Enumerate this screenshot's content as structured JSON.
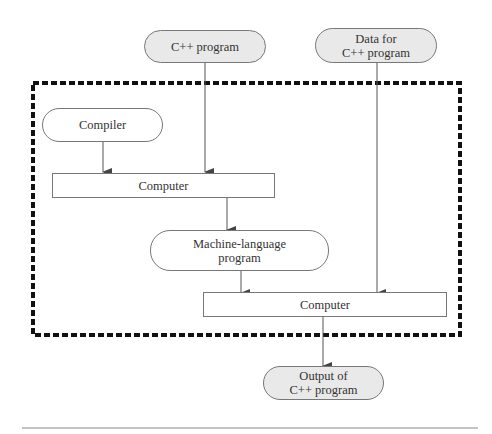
{
  "diagram": {
    "type": "flowchart",
    "title": "",
    "nodes": {
      "cpp_program": {
        "label": "C++ program",
        "shape": "rounded",
        "fill": "#e9e9e9"
      },
      "data_for": {
        "line1": "Data for",
        "line2": "C++ program",
        "shape": "rounded",
        "fill": "#e9e9e9"
      },
      "compiler": {
        "label": "Compiler",
        "shape": "rounded",
        "fill": "#ffffff"
      },
      "computer1": {
        "label": "Computer",
        "shape": "rectangle",
        "fill": "#ffffff"
      },
      "machine_lang": {
        "line1": "Machine-language",
        "line2": "program",
        "shape": "rounded",
        "fill": "#ffffff"
      },
      "computer2": {
        "label": "Computer",
        "shape": "rectangle",
        "fill": "#ffffff"
      },
      "output": {
        "line1": "Output of",
        "line2": "C++ program",
        "shape": "rounded",
        "fill": "#e9e9e9"
      }
    },
    "edges": [
      {
        "from": "C++ program",
        "to": "Computer (1)"
      },
      {
        "from": "Compiler",
        "to": "Computer (1)"
      },
      {
        "from": "Computer (1)",
        "to": "Machine-language program"
      },
      {
        "from": "Machine-language program",
        "to": "Computer (2)"
      },
      {
        "from": "Data for C++ program",
        "to": "Computer (2)"
      },
      {
        "from": "Computer (2)",
        "to": "Output of C++ program"
      }
    ],
    "boundary": {
      "style": "thick dashed",
      "color": "#111111"
    },
    "colors": {
      "fill_grey": "#e9e9e9",
      "stroke": "#777777",
      "arrow": "#444444"
    }
  }
}
